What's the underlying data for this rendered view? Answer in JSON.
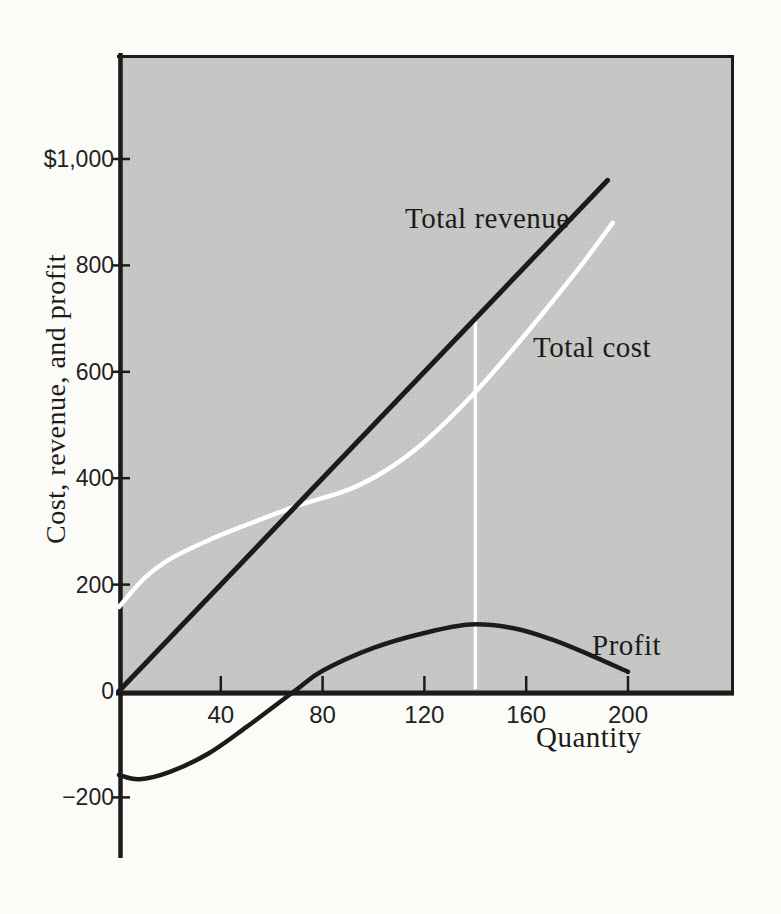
{
  "page": {
    "background": "#fbfbf8"
  },
  "colors": {
    "plot_background": "#c6c8c5",
    "plot_dot_texture": "#b4b6b3",
    "axis": "#1b1b1b",
    "line_dark": "#1b1b1b",
    "line_white": "#ffffff",
    "text": "#1b1b1b"
  },
  "chart_data": {
    "type": "line",
    "title": "",
    "xlabel": "Quantity",
    "ylabel": "Cost, revenue, and profit",
    "legend": "inline-labels",
    "grid": false,
    "xlim": [
      0,
      241
    ],
    "ylim_plot_area": [
      0,
      1200
    ],
    "ylim_axis": [
      -310,
      1200
    ],
    "x_ticks": [
      40,
      80,
      120,
      160,
      200
    ],
    "y_ticks": [
      {
        "label": "$1,000",
        "value": 1000
      },
      {
        "label": "800",
        "value": 800
      },
      {
        "label": "600",
        "value": 600
      },
      {
        "label": "400",
        "value": 400
      },
      {
        "label": "200",
        "value": 200
      },
      {
        "label": "0",
        "value": 0
      },
      {
        "label": "−200",
        "value": -200
      }
    ],
    "series": [
      {
        "name": "Total revenue",
        "color": "#1b1b1b",
        "width": 5,
        "points": [
          [
            0,
            0
          ],
          [
            192,
            960
          ]
        ]
      },
      {
        "name": "Total cost",
        "color": "#ffffff",
        "width": 4.5,
        "points": [
          [
            0,
            158
          ],
          [
            10,
            212
          ],
          [
            20,
            248
          ],
          [
            35,
            283
          ],
          [
            50,
            312
          ],
          [
            70,
            348
          ],
          [
            90,
            378
          ],
          [
            105,
            415
          ],
          [
            120,
            468
          ],
          [
            140,
            562
          ],
          [
            160,
            672
          ],
          [
            180,
            790
          ],
          [
            194,
            880
          ]
        ]
      },
      {
        "name": "Profit",
        "color": "#1b1b1b",
        "width": 4.5,
        "points": [
          [
            0,
            -158
          ],
          [
            8,
            -166
          ],
          [
            20,
            -152
          ],
          [
            35,
            -118
          ],
          [
            50,
            -68
          ],
          [
            69,
            0
          ],
          [
            80,
            38
          ],
          [
            100,
            81
          ],
          [
            120,
            109
          ],
          [
            138,
            125
          ],
          [
            155,
            118
          ],
          [
            170,
            97
          ],
          [
            185,
            68
          ],
          [
            200,
            36
          ]
        ]
      }
    ],
    "annotations": [
      {
        "type": "vline",
        "x": 140,
        "y_from": 0,
        "y_to": 700,
        "color": "#ffffff",
        "width": 3.5,
        "meaning": "profit-maximizing quantity marker from axis up to total revenue line"
      }
    ]
  }
}
